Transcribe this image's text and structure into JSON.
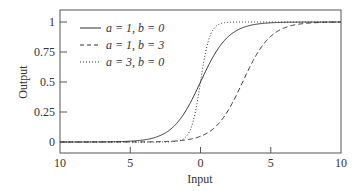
{
  "chart_data": {
    "type": "line",
    "title": "",
    "xlabel": "Input",
    "ylabel": "Output",
    "xlim": [
      -10,
      10
    ],
    "ylim": [
      0,
      1
    ],
    "grid": false,
    "legend_position": "upper left",
    "x_ticks": [
      -10,
      -5,
      0,
      5,
      10
    ],
    "x_tick_labels": [
      "10",
      "5",
      "0",
      "5",
      "10"
    ],
    "y_ticks": [
      0,
      0.25,
      0.5,
      0.75,
      1
    ],
    "y_tick_labels": [
      "0",
      "0.25",
      "0.5",
      "0.75",
      "1"
    ],
    "function": "1/(1+exp(-a*(x-b)))",
    "series": [
      {
        "name": "a = 1, b = 0",
        "a": 1,
        "b": 0,
        "style": "solid",
        "x": [
          -10,
          -5,
          -2,
          -1,
          0,
          1,
          2,
          5,
          10
        ],
        "values": [
          0.0,
          0.007,
          0.12,
          0.27,
          0.5,
          0.73,
          0.88,
          0.993,
          1.0
        ]
      },
      {
        "name": "a = 1, b = 3",
        "a": 1,
        "b": 3,
        "style": "dashed",
        "x": [
          -10,
          -5,
          0,
          2,
          3,
          4,
          5,
          8,
          10
        ],
        "values": [
          0.0,
          0.0,
          0.05,
          0.27,
          0.5,
          0.73,
          0.88,
          0.993,
          0.999
        ]
      },
      {
        "name": "a = 3, b = 0",
        "a": 3,
        "b": 0,
        "style": "dotted",
        "x": [
          -10,
          -2,
          -1,
          -0.5,
          0,
          0.5,
          1,
          2,
          10
        ],
        "values": [
          0.0,
          0.002,
          0.05,
          0.18,
          0.5,
          0.82,
          0.95,
          0.998,
          1.0
        ]
      }
    ]
  },
  "legend": {
    "items": [
      {
        "label_a": "a",
        "label_rest_1": " = 1, ",
        "label_b": "b",
        "label_rest_2": " = 0",
        "text": "a = 1, b = 0"
      },
      {
        "text": "a = 1, b = 3"
      },
      {
        "text": "a = 3, b = 0"
      }
    ]
  }
}
